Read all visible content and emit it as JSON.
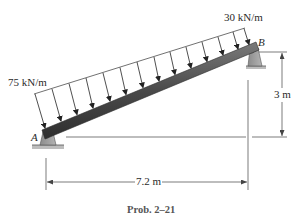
{
  "diagram": {
    "type": "inclined beam with linearly varying distributed load",
    "loads": {
      "left_intensity": "75 kN/m",
      "right_intensity": "30 kN/m",
      "arrow_count": 14
    },
    "points": {
      "left": "A",
      "right": "B"
    },
    "supports": {
      "A": "pin",
      "B": "pin"
    },
    "dimensions": {
      "horizontal": "7.2 m",
      "vertical": "3 m"
    },
    "caption": "Prob. 2–21"
  },
  "colors": {
    "beam_dark": "#3d3d3d",
    "beam_light": "#8a8a8a",
    "support": "#9a9a9a",
    "line": "#2a2a2a",
    "dim_line": "#555555"
  }
}
